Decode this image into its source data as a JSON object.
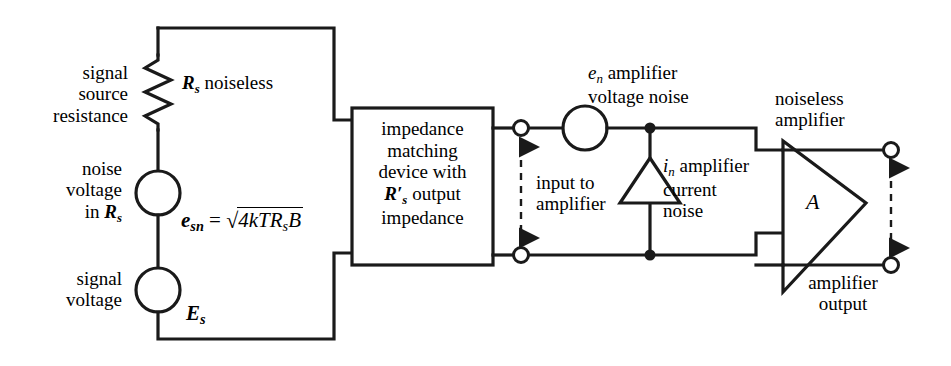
{
  "figure": {
    "type": "circuit-schematic",
    "title_absent": true
  },
  "labels": {
    "signal_source_resistance": "signal\nsource\nresistance",
    "signal_source_resistance_lines": [
      "signal",
      "source",
      "resistance"
    ],
    "rs_noiseless": "R_s noiseless",
    "rs_noiseless_sym": "R",
    "rs_noiseless_sub": "s",
    "rs_noiseless_rest": " noiseless",
    "noise_voltage_in_rs_lines": [
      "noise",
      "voltage",
      "in R"
    ],
    "noise_voltage_line1": "noise",
    "noise_voltage_line2": "voltage",
    "noise_voltage_line3_pre": "in ",
    "noise_voltage_line3_sym": "R",
    "noise_voltage_line3_sub": "s",
    "esn_sym": "e",
    "esn_sub": "sn",
    "esn_equals": " = ",
    "sqrt_glyph": "√",
    "esn_radicand": "4kTR",
    "esn_radicand_sub": "s",
    "esn_radicand_tail": "B",
    "esn_full": "e_sn = √(4kTR_sB)",
    "signal_voltage_lines": [
      "signal",
      "voltage"
    ],
    "signal_voltage_line1": "signal",
    "signal_voltage_line2": "voltage",
    "es_sym": "E",
    "es_sub": "s",
    "impedance_box_lines": [
      "impedance",
      "matching",
      "device with",
      "R′_s output",
      "impedance"
    ],
    "impedance_box_line1": "impedance",
    "impedance_box_line2": "matching",
    "impedance_box_line3": "device with",
    "impedance_box_line4_sym": "R",
    "impedance_box_line4_prime": "′",
    "impedance_box_line4_sub": "s",
    "impedance_box_line4_rest": " output",
    "impedance_box_line5": "impedance",
    "input_to_amplifier_lines": [
      "input to",
      "amplifier"
    ],
    "input_to_amplifier_line1": "input to",
    "input_to_amplifier_line2": "amplifier",
    "en_sym": "e",
    "en_sub": "n",
    "en_rest": " amplifier",
    "en_line2": "voltage noise",
    "in_sym": "i",
    "in_sub": "n",
    "in_rest": " amplifier",
    "in_line2": "current",
    "in_line3": "noise",
    "noiseless_amplifier_lines": [
      "noiseless",
      "amplifier"
    ],
    "noiseless_amplifier_line1": "noiseless",
    "noiseless_amplifier_line2": "amplifier",
    "amplifier_gain_sym": "A",
    "amplifier_output_lines": [
      "amplifier",
      "output"
    ],
    "amplifier_output_line1": "amplifier",
    "amplifier_output_line2": "output"
  },
  "colors": {
    "stroke": "#1a1a1a",
    "background": "#ffffff",
    "text": "#000000"
  },
  "components": {
    "resistor_rs": "resistor-zigzag",
    "source_esn": "voltage-source-circle",
    "source_es": "voltage-source-circle",
    "source_en": "voltage-source-circle",
    "source_in": "current-source-triangle",
    "amplifier": "triangle-amplifier",
    "impedance_box": "rectangle",
    "terminals": "open-circle-terminal",
    "junctions": "filled-dot"
  }
}
